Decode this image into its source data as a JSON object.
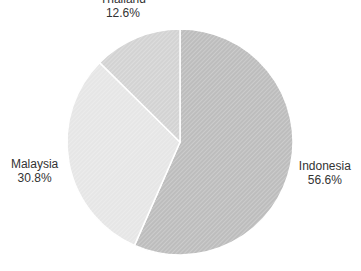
{
  "chart_data": {
    "type": "pie",
    "title": "",
    "slices": [
      {
        "label": "Indonesia",
        "value": 56.6,
        "pct_label": "56.6%",
        "color": "#bdbdbd"
      },
      {
        "label": "Malaysia",
        "value": 30.8,
        "pct_label": "30.8%",
        "color": "#e6e6e6"
      },
      {
        "label": "Thailand",
        "value": 12.6,
        "pct_label": "12.6%",
        "color": "#d3d3d3"
      }
    ],
    "start": "top",
    "direction": "clockwise",
    "legend": "none"
  }
}
